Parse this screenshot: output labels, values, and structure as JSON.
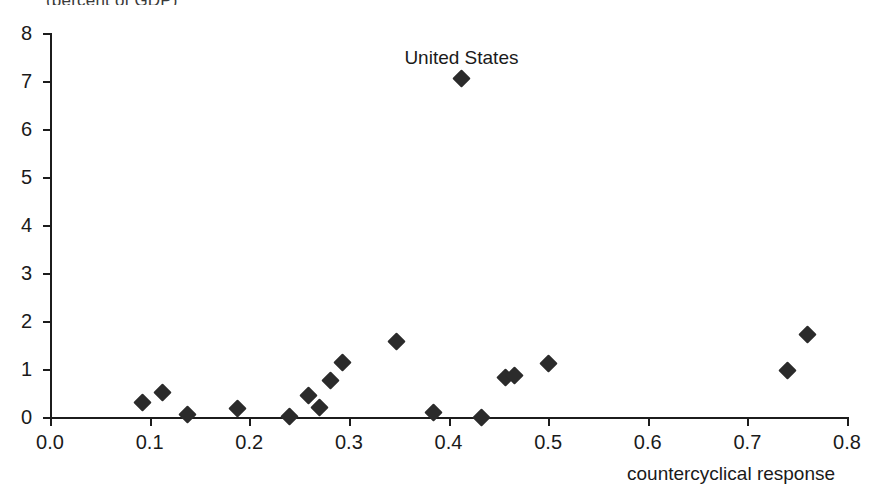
{
  "figure": {
    "title_fragment": "(percent of GDP)",
    "x_axis_title": "countercyclical response"
  },
  "chart_data": {
    "type": "scatter",
    "title": "",
    "xlabel": "countercyclical response",
    "ylabel": "",
    "xlim": [
      0.0,
      0.8
    ],
    "ylim": [
      0,
      8
    ],
    "xticks": [
      "0.0",
      "0.1",
      "0.2",
      "0.3",
      "0.4",
      "0.5",
      "0.6",
      "0.7",
      "0.8"
    ],
    "xtick_values": [
      0.0,
      0.1,
      0.2,
      0.3,
      0.4,
      0.5,
      0.6,
      0.7,
      0.8
    ],
    "yticks": [
      "0",
      "1",
      "2",
      "3",
      "4",
      "5",
      "6",
      "7",
      "8"
    ],
    "ytick_values": [
      0,
      1,
      2,
      3,
      4,
      5,
      6,
      7,
      8
    ],
    "grid": false,
    "legend": null,
    "marker": {
      "shape": "diamond",
      "color": "#2b2b2b",
      "size": 13
    },
    "points": [
      {
        "x": 0.093,
        "y": 0.3,
        "label": ""
      },
      {
        "x": 0.113,
        "y": 0.52,
        "label": ""
      },
      {
        "x": 0.138,
        "y": 0.06,
        "label": ""
      },
      {
        "x": 0.188,
        "y": 0.17,
        "label": ""
      },
      {
        "x": 0.24,
        "y": 0.02,
        "label": ""
      },
      {
        "x": 0.259,
        "y": 0.44,
        "label": ""
      },
      {
        "x": 0.271,
        "y": 0.2,
        "label": ""
      },
      {
        "x": 0.282,
        "y": 0.76,
        "label": ""
      },
      {
        "x": 0.294,
        "y": 1.14,
        "label": ""
      },
      {
        "x": 0.348,
        "y": 1.58,
        "label": ""
      },
      {
        "x": 0.385,
        "y": 0.1,
        "label": ""
      },
      {
        "x": 0.413,
        "y": 7.05,
        "label": "United States"
      },
      {
        "x": 0.433,
        "y": 0.0,
        "label": ""
      },
      {
        "x": 0.457,
        "y": 0.82,
        "label": ""
      },
      {
        "x": 0.466,
        "y": 0.86,
        "label": ""
      },
      {
        "x": 0.5,
        "y": 1.12,
        "label": ""
      },
      {
        "x": 0.74,
        "y": 0.97,
        "label": ""
      },
      {
        "x": 0.76,
        "y": 1.72,
        "label": ""
      }
    ],
    "annotations": [
      {
        "text": "United States",
        "x": 0.413,
        "y": 7.05
      }
    ]
  }
}
